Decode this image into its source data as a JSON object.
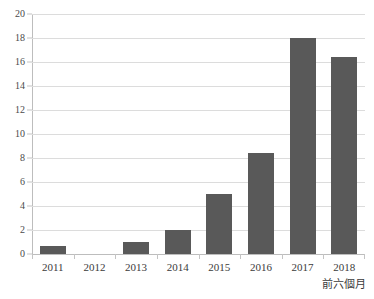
{
  "chart_data": {
    "type": "bar",
    "title": "",
    "subtitle": "",
    "xlabel": "",
    "ylabel": "",
    "categories": [
      "2011",
      "2012",
      "2013",
      "2014",
      "2015",
      "2016",
      "2017",
      "2018"
    ],
    "values": [
      0.7,
      0,
      1.0,
      2.0,
      5.0,
      8.4,
      18.0,
      16.4
    ],
    "ylim": [
      0,
      20
    ],
    "ytick_values": [
      0,
      2,
      4,
      6,
      8,
      10,
      12,
      14,
      16,
      18,
      20
    ],
    "ytick_labels": [
      "0",
      "2",
      "4",
      "6",
      "8",
      "10",
      "12",
      "14",
      "16",
      "18",
      "20"
    ],
    "grid": true,
    "legend": false,
    "legend_position": "none",
    "annotations": [
      {
        "text": "前六個月",
        "attached_to_category": "2018",
        "position": "below-axis-label"
      }
    ],
    "bar_color": "#595959",
    "gridline_color": "#dcdcdc",
    "axis_color": "#bdbdbd",
    "background_color": "#ffffff"
  },
  "clipped_title": {
    "text": ""
  }
}
